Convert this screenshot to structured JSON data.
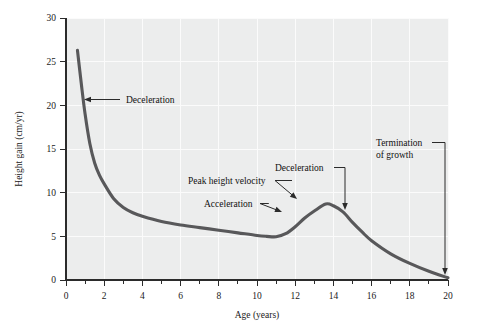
{
  "chart_data": {
    "type": "line",
    "title": "",
    "xlabel": "Age (years)",
    "ylabel": "Height gain (cm/yr)",
    "xlim": [
      0,
      20
    ],
    "ylim": [
      0,
      30
    ],
    "grid": true,
    "legend": "none",
    "x_ticks_major": [
      0,
      2,
      4,
      6,
      8,
      10,
      12,
      14,
      16,
      18,
      20
    ],
    "x_tick_labels": [
      "0",
      "2",
      "4",
      "6",
      "8",
      "10",
      "12",
      "14",
      "16",
      "18",
      "20"
    ],
    "x_ticks_minor": [
      1,
      3,
      5,
      7,
      9,
      11,
      13,
      15,
      17,
      19
    ],
    "y_ticks_major": [
      0,
      5,
      10,
      15,
      20,
      25,
      30
    ],
    "y_tick_labels": [
      "0",
      "5",
      "10",
      "15",
      "20",
      "25",
      "30"
    ],
    "series": [
      {
        "name": "Height velocity",
        "color": "#58585a",
        "x": [
          0.6,
          0.8,
          1.0,
          1.25,
          1.5,
          1.75,
          2.0,
          2.5,
          3.0,
          3.5,
          4.0,
          5.0,
          6.0,
          7.0,
          8.0,
          9.0,
          10.0,
          10.5,
          11.0,
          11.5,
          12.0,
          12.5,
          13.0,
          13.6,
          14.0,
          14.5,
          15.0,
          15.5,
          16.0,
          17.0,
          18.0,
          19.0,
          20.0
        ],
        "y": [
          26.3,
          22.5,
          19.0,
          15.6,
          13.4,
          12.0,
          11.0,
          9.3,
          8.3,
          7.7,
          7.3,
          6.7,
          6.3,
          6.0,
          5.7,
          5.4,
          5.1,
          5.0,
          4.95,
          5.3,
          6.1,
          7.1,
          7.9,
          8.7,
          8.5,
          7.8,
          6.6,
          5.5,
          4.5,
          3.0,
          1.9,
          1.0,
          0.25
        ]
      }
    ],
    "annotations": [
      {
        "id": "deceleration-infancy",
        "label": "Deceleration",
        "text_x": 126,
        "text_y": 103,
        "anchor": "start",
        "arrow": "leftward",
        "target_x": 84,
        "target_y": 99
      },
      {
        "id": "peak-height-velocity",
        "label": "Peak height velocity",
        "text_x": 188,
        "text_y": 184,
        "anchor": "start",
        "arrow": "down-right",
        "target_x": 297,
        "target_y": 199
      },
      {
        "id": "acceleration",
        "label": "Acceleration",
        "text_x": 204,
        "text_y": 207,
        "anchor": "start",
        "arrow": "down-right",
        "target_x": 282,
        "target_y": 212
      },
      {
        "id": "deceleration-adolescence",
        "label": "Deceleration",
        "text_x": 275,
        "text_y": 171,
        "anchor": "start",
        "arrow": "down",
        "target_x": 345,
        "target_y": 210
      },
      {
        "id": "termination-of-growth",
        "label_line1": "Termination",
        "label_line2": "of growth",
        "text_x": 376,
        "text_y": 146,
        "anchor": "start",
        "arrow": "down",
        "target_x": 445,
        "target_y": 275
      }
    ]
  },
  "colors": {
    "plot_background": "#eceded",
    "gridline": "#fbfbfb",
    "curve": "#58585a",
    "axis": "#2b2b2b",
    "text": "#141414",
    "page_background": "#ffffff"
  }
}
